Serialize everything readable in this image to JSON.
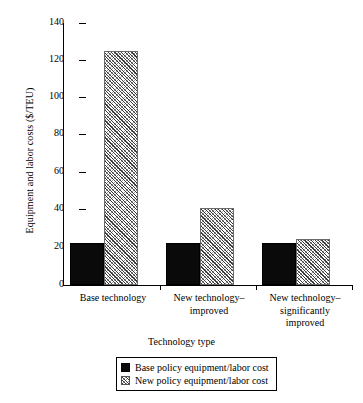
{
  "chart_data": {
    "type": "bar",
    "title": "",
    "xlabel": "Technology type",
    "ylabel": "Equipment and labor costs ($/TEU)",
    "categories": [
      "Base technology",
      "New technology–improved",
      "New technology–significantly improved"
    ],
    "category_lines": [
      [
        "Base technology"
      ],
      [
        "New technology–",
        "improved"
      ],
      [
        "New technology–",
        "significantly",
        "improved"
      ]
    ],
    "series": [
      {
        "name": "Base policy equipment/labor cost",
        "values": [
          22.5,
          22.5,
          22.5
        ],
        "fill": "solid-black"
      },
      {
        "name": "New policy equipment/labor cost",
        "values": [
          125,
          41,
          24.5
        ],
        "fill": "diagonal-hatch"
      }
    ],
    "ylim": [
      0,
      140
    ],
    "yticks": [
      0,
      20,
      40,
      60,
      80,
      100,
      120,
      140
    ],
    "ytick_labels": [
      "0",
      "20",
      "40",
      "60",
      "80",
      "100",
      "120",
      "140"
    ],
    "grid": false,
    "legend_position": "bottom-center"
  },
  "legend": {
    "entries": [
      {
        "label": "Base policy equipment/labor cost",
        "swatch": "solid"
      },
      {
        "label": "New policy equipment/labor cost",
        "swatch": "hatch"
      }
    ]
  },
  "colors": {
    "series_base": "#0a0a0a",
    "series_new": "#ffffff",
    "axis": "#000000",
    "background": "#ffffff"
  }
}
